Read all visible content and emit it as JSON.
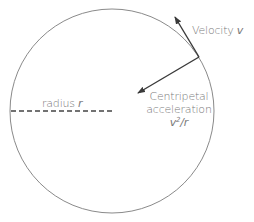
{
  "diagram": {
    "circle": {
      "cx": 112,
      "cy": 111,
      "r": 102,
      "stroke": "#8a8a8a"
    },
    "radius_line": {
      "x1": 11,
      "y1": 111,
      "x2": 112,
      "y2": 111,
      "stroke": "#444444",
      "dash": "5,3"
    },
    "velocity_arrow": {
      "x1": 199,
      "y1": 57,
      "x2": 175,
      "y2": 17,
      "stroke": "#3a3a3a"
    },
    "centripetal_arrow": {
      "x1": 199,
      "y1": 57,
      "x2": 138,
      "y2": 93,
      "stroke": "#3a3a3a"
    },
    "labels": {
      "velocity": {
        "text": "Velocity ",
        "symbol": "v"
      },
      "radius": {
        "text": "radius ",
        "symbol": "r"
      },
      "centripetal": {
        "line1": "Centripetal",
        "line2": "acceleration",
        "formula_base": "v",
        "formula_exp": "2",
        "formula_rest": "/r"
      }
    },
    "colors": {
      "text": "#7a7a7a",
      "arrow": "#3a3a3a",
      "circle": "#8a8a8a",
      "background": "#ffffff"
    }
  }
}
